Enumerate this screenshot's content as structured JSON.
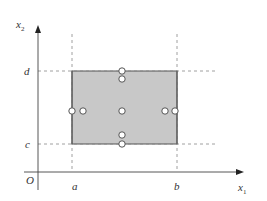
{
  "diagram": {
    "type": "coordinate-region",
    "axes": {
      "x_label": "x",
      "x_label_sub": "1",
      "y_label": "x",
      "y_label_sub": "2",
      "origin_label": "O"
    },
    "bounds": {
      "a_label": "a",
      "b_label": "b",
      "c_label": "c",
      "d_label": "d"
    },
    "region": {
      "description": "rectangle [a,b] x [c,d]",
      "fill": "#c8c8c8",
      "edge": "#555555"
    },
    "points": [
      {
        "name": "top-edge",
        "cx": 122,
        "cy": 71
      },
      {
        "name": "top-inner",
        "cx": 122,
        "cy": 79
      },
      {
        "name": "left-edge",
        "cx": 72,
        "cy": 111
      },
      {
        "name": "left-inner",
        "cx": 83,
        "cy": 111
      },
      {
        "name": "center",
        "cx": 122,
        "cy": 111
      },
      {
        "name": "right-inner",
        "cx": 165,
        "cy": 111
      },
      {
        "name": "right-edge",
        "cx": 175,
        "cy": 111
      },
      {
        "name": "bottom-inner",
        "cx": 122,
        "cy": 135
      },
      {
        "name": "bottom-edge",
        "cx": 122,
        "cy": 144
      }
    ],
    "colors": {
      "axis": "#444444",
      "dashed": "#888888",
      "point_fill": "#ffffff",
      "point_stroke": "#555555"
    }
  }
}
